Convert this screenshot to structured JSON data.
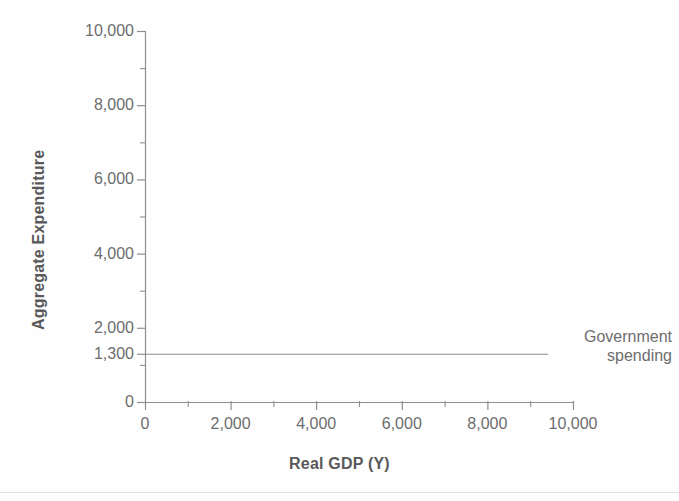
{
  "chart_data": {
    "type": "line",
    "title": "",
    "xlabel": "Real GDP (Y)",
    "ylabel": "Aggregate Expenditure",
    "xlim": [
      0,
      10000
    ],
    "ylim": [
      0,
      10000
    ],
    "grid": false,
    "legend_position": "inline-annotation-right",
    "x_ticks": [
      0,
      2000,
      4000,
      6000,
      8000,
      10000
    ],
    "x_tick_labels": [
      "0",
      "2,000",
      "4,000",
      "6,000",
      "8,000",
      "10,000"
    ],
    "x_minor_ticks": [
      1000,
      3000,
      5000,
      7000,
      9000
    ],
    "y_ticks": [
      0,
      1300,
      2000,
      4000,
      6000,
      8000,
      10000
    ],
    "y_tick_labels": [
      "0",
      "1,300",
      "2,000",
      "4,000",
      "6,000",
      "8,000",
      "10,000"
    ],
    "y_minor_ticks": [
      1000,
      3000,
      5000,
      7000,
      9000
    ],
    "series": [
      {
        "name": "Government spending",
        "type": "line",
        "constant_value": 1300,
        "x": [
          0,
          10000
        ],
        "values": [
          1300,
          1300
        ],
        "color": "#8c8c8c",
        "annotation_lines": [
          "Government",
          "spending"
        ]
      }
    ]
  },
  "axes": {
    "y_title": "Aggregate Expenditure",
    "x_title": "Real GDP (Y)"
  },
  "annotations": {
    "gov_spending_line1": "Government",
    "gov_spending_line2": "spending"
  },
  "ticks": {
    "y": [
      {
        "value": 10000,
        "label": "10,000"
      },
      {
        "value": 8000,
        "label": "8,000"
      },
      {
        "value": 6000,
        "label": "6,000"
      },
      {
        "value": 4000,
        "label": "4,000"
      },
      {
        "value": 2000,
        "label": "2,000"
      },
      {
        "value": 1300,
        "label": "1,300"
      },
      {
        "value": 0,
        "label": "0"
      }
    ],
    "x": [
      {
        "value": 0,
        "label": "0"
      },
      {
        "value": 2000,
        "label": "2,000"
      },
      {
        "value": 4000,
        "label": "4,000"
      },
      {
        "value": 6000,
        "label": "6,000"
      },
      {
        "value": 8000,
        "label": "8,000"
      },
      {
        "value": 10000,
        "label": "10,000"
      }
    ]
  },
  "colors": {
    "axis": "#8f8f8f",
    "series_line": "#8c8c8c",
    "text": "#6d6d6d",
    "title_text": "#59595b",
    "background": "#fefefe"
  }
}
